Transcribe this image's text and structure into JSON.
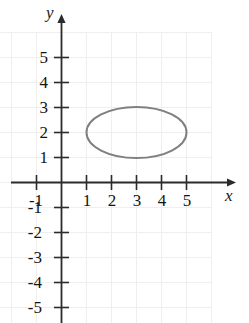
{
  "figure": {
    "width": 249,
    "height": 323,
    "background_color": "#ffffff",
    "grid_color": "#f0eeee",
    "axis_color": "#2b2b2b",
    "curve_color": "#808080",
    "label_color": "#141414"
  },
  "axes": {
    "x_axis_label": "x",
    "y_axis_label": "y",
    "origin_px": {
      "x": 61,
      "y": 182
    },
    "unit_px": 25,
    "x_range": [
      -2,
      6.8
    ],
    "y_range": [
      -5.6,
      6.5
    ],
    "grid": true,
    "x_tick_labels": [
      "-1",
      "1",
      "2",
      "3",
      "4",
      "5"
    ],
    "x_tick_values": [
      -1,
      1,
      2,
      3,
      4,
      5
    ],
    "y_tick_labels": [
      "5",
      "4",
      "3",
      "2",
      "1",
      "-1",
      "-2",
      "-3",
      "-4",
      "-5"
    ],
    "y_tick_values": [
      5,
      4,
      3,
      2,
      1,
      -1,
      -2,
      -3,
      -4,
      -5
    ]
  },
  "chart_data": {
    "type": "scatter",
    "title": "",
    "xlabel": "x",
    "ylabel": "y",
    "xlim": [
      -2,
      6.8
    ],
    "ylim": [
      -5.6,
      6.5
    ],
    "grid": true,
    "legend": "none",
    "xticks": [
      -1,
      1,
      2,
      3,
      4,
      5
    ],
    "yticks": [
      5,
      4,
      3,
      2,
      1,
      -1,
      -2,
      -3,
      -4,
      -5
    ],
    "series": [
      {
        "name": "ellipse",
        "type": "ellipse",
        "center": [
          3,
          2
        ],
        "semi_axis_x": 2,
        "semi_axis_y": 1,
        "x_intercept_extent": [
          1,
          5
        ],
        "y_intercept_extent": [
          1,
          3
        ],
        "equation": "(x-3)^2/4 + (y-2)^2/1 = 1",
        "stroke_color": "#808080",
        "stroke_width": 2,
        "fill": "none"
      }
    ],
    "annotations": []
  }
}
